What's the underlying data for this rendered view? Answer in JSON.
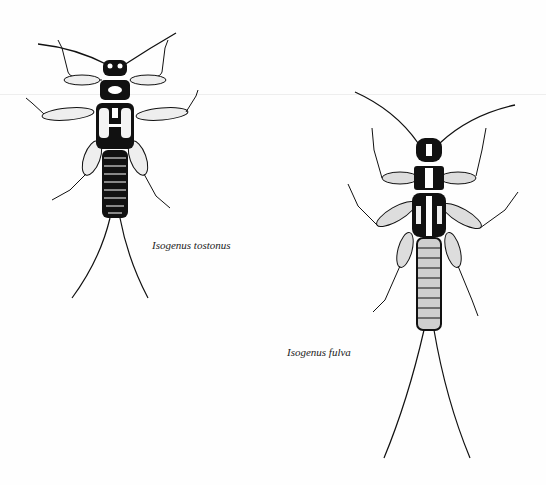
{
  "figure": {
    "specimens": [
      {
        "id": "left",
        "label": "Isogenus tostonus"
      },
      {
        "id": "right",
        "label": "Isogenus fulva"
      }
    ],
    "colors": {
      "ink": "#111111",
      "paper": "#fefefe",
      "stipple": "#d9d9d9"
    }
  }
}
